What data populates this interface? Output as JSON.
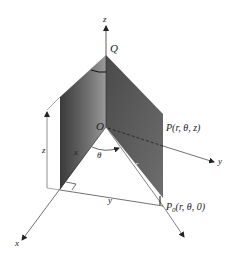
{
  "diagram": {
    "axes": {
      "x": "x",
      "y": "y",
      "z": "z"
    },
    "points": {
      "top": "Q",
      "origin": "O",
      "point": "P(r,  θ,  z)",
      "projection": "P",
      "projection_sub": "0",
      "projection_coords": "(r,  θ,  0)"
    },
    "labels": {
      "height": "z",
      "x_component": "x",
      "y_component": "y",
      "angle": "θ",
      "radius": "r"
    },
    "colors": {
      "panel_left_dark": "#3a3a3a",
      "panel_left_light": "#8a8a8a",
      "panel_right": "#5c5c5c",
      "line": "#333333"
    }
  }
}
